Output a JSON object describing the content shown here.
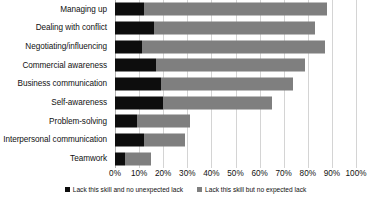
{
  "chart_data": {
    "type": "bar",
    "orientation": "horizontal",
    "stacked": true,
    "title": "",
    "xlabel": "",
    "ylabel": "",
    "xlim": [
      0,
      100
    ],
    "grid": true,
    "legend_position": "bottom",
    "categories": [
      "Managing up",
      "Dealing with conflict",
      "Negotiating/influencing",
      "Commercial awareness",
      "Business communication",
      "Self-awareness",
      "Problem-solving",
      "Interpersonal communication",
      "Teamwork"
    ],
    "series": [
      {
        "name": "Lack this skill and no unexpected lack",
        "color": "#0d0d0d",
        "values": [
          12,
          16,
          11,
          17,
          19,
          20,
          9,
          12,
          4
        ]
      },
      {
        "name": "Lack this skill but no expected lack",
        "color": "#7f7f7f",
        "values": [
          76,
          67,
          76,
          62,
          55,
          45,
          22,
          17,
          11
        ]
      }
    ],
    "totals": [
      88,
      83,
      87,
      79,
      74,
      65,
      31,
      29,
      15
    ],
    "xticks": [
      0,
      10,
      20,
      30,
      40,
      50,
      60,
      70,
      80,
      90,
      100
    ],
    "xtick_labels": [
      "0%",
      "10%",
      "20%",
      "30%",
      "40%",
      "50%",
      "60%",
      "70%",
      "80%",
      "90%",
      "100%"
    ]
  },
  "legend": {
    "items": [
      {
        "label": "Lack this skill and no unexpected lack",
        "color": "#0d0d0d"
      },
      {
        "label": "Lack this skill but no expected lack",
        "color": "#7f7f7f"
      }
    ]
  }
}
